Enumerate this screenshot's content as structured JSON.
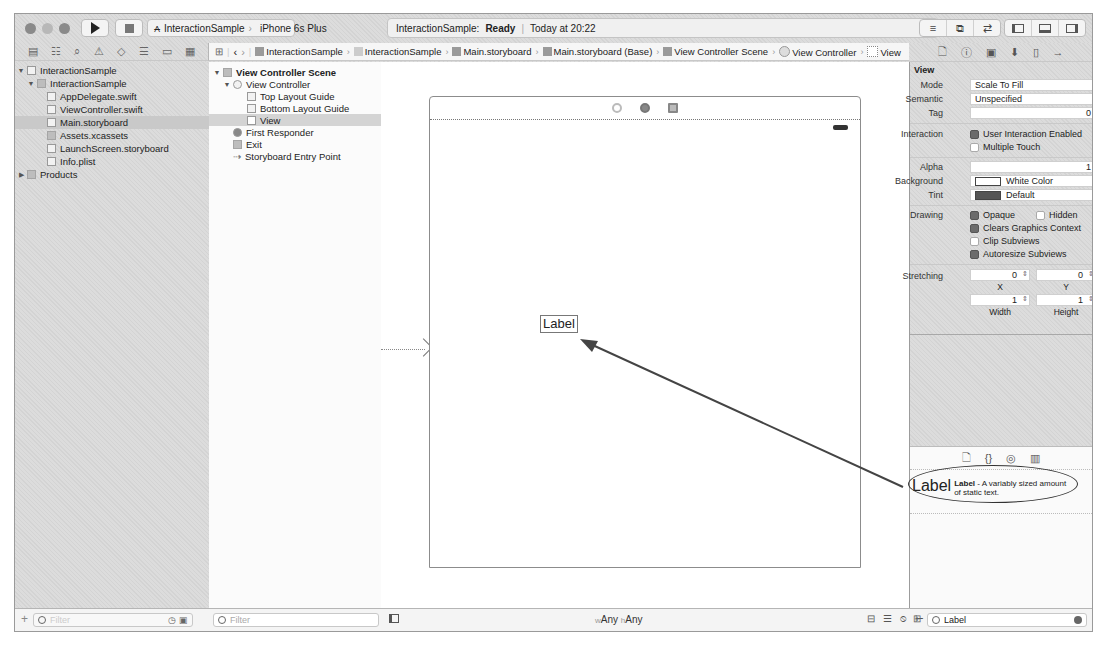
{
  "toolbar": {
    "run_label": "Run",
    "stop_label": "Stop",
    "scheme": "InteractionSample",
    "device": "iPhone 6s Plus",
    "activity": {
      "project": "InteractionSample:",
      "status": "Ready",
      "time": "Today at 20:22"
    },
    "editor_buttons": [
      "standard-editor",
      "assistant-editor",
      "version-editor"
    ],
    "pane_buttons": [
      "navigator",
      "debug-area",
      "utilities"
    ]
  },
  "navigator": {
    "tabs": [
      "project",
      "symbol",
      "find",
      "issue",
      "test",
      "debug",
      "breakpoint",
      "report"
    ],
    "items": [
      {
        "label": "InteractionSample",
        "indent": 0,
        "expanded": true,
        "kind": "project"
      },
      {
        "label": "InteractionSample",
        "indent": 1,
        "expanded": true,
        "kind": "group"
      },
      {
        "label": "AppDelegate.swift",
        "indent": 2,
        "kind": "swift"
      },
      {
        "label": "ViewController.swift",
        "indent": 2,
        "kind": "swift"
      },
      {
        "label": "Main.storyboard",
        "indent": 2,
        "kind": "storyboard",
        "selected": true
      },
      {
        "label": "Assets.xcassets",
        "indent": 2,
        "kind": "assets"
      },
      {
        "label": "LaunchScreen.storyboard",
        "indent": 2,
        "kind": "storyboard"
      },
      {
        "label": "Info.plist",
        "indent": 2,
        "kind": "plist"
      },
      {
        "label": "Products",
        "indent": 0,
        "expanded": false,
        "kind": "group"
      }
    ],
    "filter_placeholder": "Filter"
  },
  "jumpbar": {
    "crumbs": [
      "InteractionSample",
      "InteractionSample",
      "Main.storyboard",
      "Main.storyboard (Base)",
      "View Controller Scene",
      "View Controller",
      "View"
    ]
  },
  "outline": {
    "items": [
      {
        "label": "View Controller Scene",
        "indent": 0,
        "bold": true
      },
      {
        "label": "View Controller",
        "indent": 1
      },
      {
        "label": "Top Layout Guide",
        "indent": 2
      },
      {
        "label": "Bottom Layout Guide",
        "indent": 2
      },
      {
        "label": "View",
        "indent": 2,
        "selected": true
      },
      {
        "label": "First Responder",
        "indent": 1
      },
      {
        "label": "Exit",
        "indent": 1
      },
      {
        "label": "Storyboard Entry Point",
        "indent": 1
      }
    ],
    "filter_placeholder": "Filter"
  },
  "canvas": {
    "label_text": "Label",
    "size_class": {
      "w_prefix": "w",
      "w": "Any",
      "h_prefix": "h",
      "h": "Any"
    }
  },
  "inspector": {
    "section": "View",
    "mode": {
      "label": "Mode",
      "value": "Scale To Fill"
    },
    "semantic": {
      "label": "Semantic",
      "value": "Unspecified"
    },
    "tag": {
      "label": "Tag",
      "value": "0"
    },
    "interaction": {
      "label": "Interaction",
      "user_interaction_enabled": {
        "label": "User Interaction Enabled",
        "checked": true
      },
      "multiple_touch": {
        "label": "Multiple Touch",
        "checked": false
      }
    },
    "alpha": {
      "label": "Alpha",
      "value": "1"
    },
    "background": {
      "label": "Background",
      "value": "White Color",
      "swatch": "#ffffff"
    },
    "tint": {
      "label": "Tint",
      "value": "Default",
      "swatch": "#555555"
    },
    "drawing": {
      "label": "Drawing",
      "opaque": {
        "label": "Opaque",
        "checked": true
      },
      "hidden": {
        "label": "Hidden",
        "checked": false
      },
      "clears_graphics_context": {
        "label": "Clears Graphics Context",
        "checked": true
      },
      "clip_subviews": {
        "label": "Clip Subviews",
        "checked": false
      },
      "autoresize_subviews": {
        "label": "Autoresize Subviews",
        "checked": true
      }
    },
    "stretching": {
      "label": "Stretching",
      "x": "0",
      "x_label": "X",
      "y": "0",
      "y_label": "Y",
      "width": "1",
      "width_label": "Width",
      "height": "1",
      "height_label": "Height"
    }
  },
  "library": {
    "tabs": [
      "file-template",
      "code-snippet",
      "object",
      "media"
    ],
    "item": {
      "icon_text": "Label",
      "title": "Label",
      "description": " - A variably sized amount of static text."
    },
    "filter_value": "Label"
  }
}
